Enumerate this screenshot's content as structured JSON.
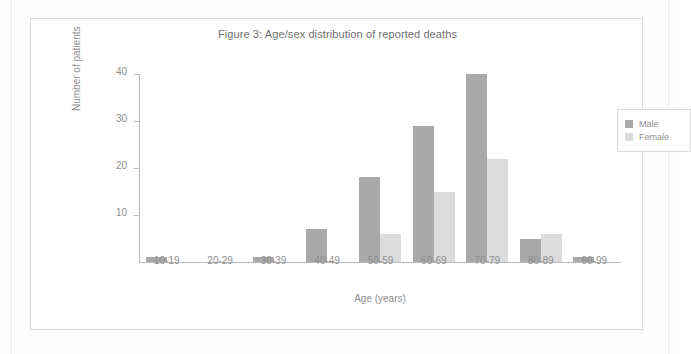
{
  "figure": {
    "title": "Figure 3: Age/sex distribution of reported deaths"
  },
  "legend": {
    "position": "top-right",
    "entries": [
      {
        "label": "Male",
        "color": "#a9a9a9"
      },
      {
        "label": "Female",
        "color": "#dcdcdc"
      }
    ]
  },
  "axes": {
    "y_ticks": [
      "40",
      "30",
      "20",
      "10"
    ],
    "y_title": "Number of patients",
    "x_title": "Age (years)"
  },
  "chart_data": {
    "type": "bar",
    "title": "Figure 3: Age/sex distribution of reported deaths",
    "xlabel": "Age (years)",
    "ylabel": "Number of patients",
    "categories": [
      "10-19",
      "20-29",
      "30-39",
      "40-49",
      "50-59",
      "60-69",
      "70-79",
      "80-89",
      "90-99"
    ],
    "series": [
      {
        "name": "Male",
        "color": "#a9a9a9",
        "values": [
          1,
          0,
          1,
          7,
          18,
          29,
          40,
          5,
          1
        ]
      },
      {
        "name": "Female",
        "color": "#dcdcdc",
        "values": [
          0,
          0,
          0,
          0,
          6,
          15,
          22,
          6,
          0
        ]
      }
    ],
    "ylim": [
      0,
      40
    ],
    "yticks": [
      10,
      20,
      30,
      40
    ],
    "grid": false,
    "legend_position": "top-right"
  }
}
